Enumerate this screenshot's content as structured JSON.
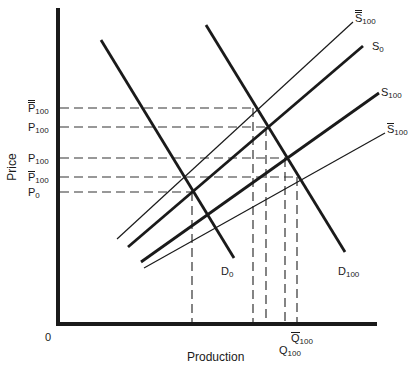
{
  "diagram": {
    "axes": {
      "x_title": "Production",
      "y_title": "Price",
      "origin_label": "0"
    },
    "curves": {
      "supply_double_bar": {
        "base": "S",
        "sub": "100",
        "bar": "double",
        "weight": "thin"
      },
      "supply_0": {
        "base": "S",
        "sub": "0",
        "bar": "none",
        "weight": "thick"
      },
      "supply_100": {
        "base": "S",
        "sub": "100",
        "bar": "none",
        "weight": "thick"
      },
      "supply_bar": {
        "base": "S",
        "sub": "100",
        "bar": "single",
        "weight": "thin"
      },
      "demand_0": {
        "base": "D",
        "sub": "0",
        "weight": "thick"
      },
      "demand_100": {
        "base": "D",
        "sub": "100",
        "weight": "thick"
      }
    },
    "price_labels": [
      {
        "base": "P",
        "sub": "100",
        "bar": "double"
      },
      {
        "base": "P",
        "sub": "100",
        "bar": "none"
      },
      {
        "base": "P",
        "sub": "100",
        "bar": "none"
      },
      {
        "base": "P",
        "sub": "100",
        "bar": "single"
      },
      {
        "base": "P",
        "sub": "0",
        "bar": "none"
      }
    ],
    "quantity_labels": [
      {
        "base": "Q",
        "sub": "100",
        "bar": "single"
      },
      {
        "base": "Q",
        "sub": "100",
        "bar": "none"
      }
    ]
  }
}
